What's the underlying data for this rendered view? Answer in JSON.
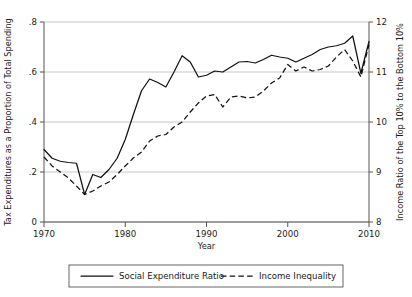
{
  "chart_data": {
    "type": "line",
    "title": "",
    "xlabel": "Year",
    "ylabel": "Tax Expenditures as a Proportion of Total Spending",
    "y2label": "Income Ratio of the Top 10% to the Bottom 10%",
    "xlim": [
      1969,
      2011
    ],
    "ylim": [
      0,
      0.8
    ],
    "y2lim": [
      8,
      12
    ],
    "xticks": [
      1970,
      1980,
      1990,
      2000,
      2010
    ],
    "xticklabels": [
      "1970",
      "1980",
      "1990",
      "2000",
      "2010"
    ],
    "yticks": [
      0,
      0.2,
      0.4,
      0.6,
      0.8
    ],
    "yticklabels": [
      "0",
      ".2",
      ".4",
      ".6",
      ".8"
    ],
    "y2ticks": [
      8,
      9,
      10,
      11,
      12
    ],
    "y2ticklabels": [
      "8",
      "9",
      "10",
      "11",
      "12"
    ],
    "grid": "horizontal",
    "legend_position": "below",
    "series": [
      {
        "name": "Social Expenditure Ratio",
        "style": "solid",
        "axis": "left",
        "color": "#111111",
        "x": [
          1970,
          1971,
          1972,
          1973,
          1974,
          1975,
          1976,
          1977,
          1978,
          1979,
          1980,
          1981,
          1982,
          1983,
          1984,
          1985,
          1986,
          1987,
          1988,
          1989,
          1990,
          1991,
          1992,
          1993,
          1994,
          1995,
          1996,
          1997,
          1998,
          1999,
          2000,
          2001,
          2002,
          2003,
          2004,
          2005,
          2006,
          2007,
          2008,
          2009,
          2010
        ],
        "values": [
          0.29,
          0.255,
          0.243,
          0.238,
          0.235,
          0.11,
          0.19,
          0.178,
          0.21,
          0.255,
          0.33,
          0.43,
          0.525,
          0.572,
          0.558,
          0.54,
          0.6,
          0.665,
          0.64,
          0.58,
          0.587,
          0.604,
          0.6,
          0.62,
          0.64,
          0.642,
          0.636,
          0.65,
          0.667,
          0.66,
          0.655,
          0.64,
          0.655,
          0.67,
          0.69,
          0.7,
          0.705,
          0.715,
          0.744,
          0.595,
          0.722
        ]
      },
      {
        "name": "Income Inequality",
        "style": "dashed",
        "axis": "right",
        "color": "#111111",
        "x": [
          1970,
          1971,
          1972,
          1973,
          1974,
          1975,
          1976,
          1977,
          1978,
          1979,
          1980,
          1981,
          1982,
          1983,
          1984,
          1985,
          1986,
          1987,
          1988,
          1989,
          1990,
          1991,
          1992,
          1993,
          1994,
          1995,
          1996,
          1997,
          1998,
          1999,
          2000,
          2001,
          2002,
          2003,
          2004,
          2005,
          2006,
          2007,
          2008,
          2009,
          2010
        ],
        "values": [
          9.3,
          9.12,
          9.0,
          8.88,
          8.72,
          8.55,
          8.62,
          8.72,
          8.8,
          8.95,
          9.12,
          9.28,
          9.4,
          9.62,
          9.72,
          9.75,
          9.9,
          10.0,
          10.2,
          10.38,
          10.52,
          10.55,
          10.3,
          10.5,
          10.52,
          10.48,
          10.5,
          10.62,
          10.78,
          10.88,
          11.15,
          11.02,
          11.1,
          11.02,
          11.05,
          11.12,
          11.3,
          11.45,
          11.22,
          10.9,
          11.55
        ]
      }
    ]
  },
  "legend": {
    "entries": [
      {
        "label": "Social Expenditure Ratio",
        "style": "solid"
      },
      {
        "label": "Income Inequality",
        "style": "dashed"
      }
    ]
  }
}
